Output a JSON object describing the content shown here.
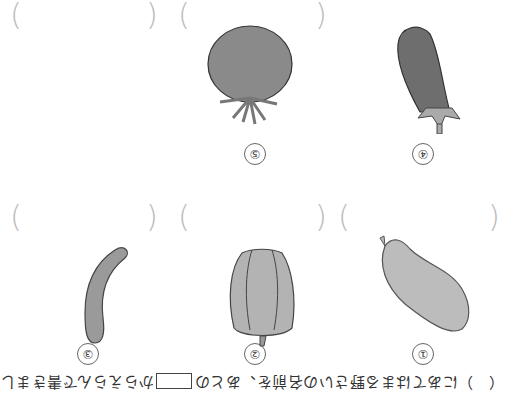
{
  "orientation": "rotated-180",
  "instruction": {
    "before": "（　）にあてはまる野さいの名前を、あとの",
    "after": "からえらんで書きましょう。"
  },
  "items": [
    {
      "number": "①",
      "vegetable": "sweet-potato"
    },
    {
      "number": "②",
      "vegetable": "green-pepper"
    },
    {
      "number": "③",
      "vegetable": "cucumber"
    },
    {
      "number": "④",
      "vegetable": "eggplant"
    },
    {
      "number": "⑤",
      "vegetable": "tomato"
    }
  ],
  "answer_brackets": {
    "open": "(",
    "close": ")"
  }
}
